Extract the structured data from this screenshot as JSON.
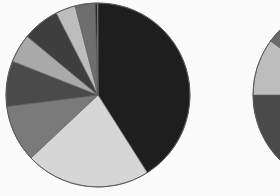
{
  "chart_data": [
    {
      "type": "pie",
      "title": "",
      "start_angle_deg": 0,
      "direction": "clockwise",
      "center": [
        98,
        95
      ],
      "radius": 92,
      "categories": [
        "Slice 1",
        "Slice 2",
        "Slice 3",
        "Slice 4",
        "Slice 5",
        "Slice 6",
        "Slice 7",
        "Slice 8",
        "Slice 9",
        "Slice 10"
      ],
      "values": [
        41,
        22,
        10,
        8,
        5,
        6.5,
        3.5,
        3.5,
        0.4,
        0.1
      ],
      "colors": [
        "#1e1e1e",
        "#d6d6d6",
        "#7a7a7a",
        "#4a4a4a",
        "#a9a9a9",
        "#3e3e3e",
        "#bdbdbd",
        "#6e6e6e",
        "#2a2a2a",
        "#f0f0f0"
      ],
      "legend": "none"
    },
    {
      "type": "pie",
      "title": "",
      "partial": true,
      "center": [
        345,
        95
      ],
      "radius": 92,
      "visible_segments_left_edge": [
        {
          "color": "#6a6a6a"
        },
        {
          "color": "#bdbdbd"
        },
        {
          "color": "#4a4a4a"
        }
      ],
      "categories": [
        "Seg A",
        "Seg B",
        "Seg C",
        "Seg D"
      ],
      "values": [
        30,
        45,
        10,
        15
      ],
      "colors": [
        "#1e1e1e",
        "#4a4a4a",
        "#bdbdbd",
        "#6a6a6a"
      ],
      "start_angle_deg": 0,
      "direction": "clockwise",
      "legend": "none"
    }
  ],
  "style": {
    "background": "#fbfbfb",
    "stroke": "#5a5a5a"
  }
}
